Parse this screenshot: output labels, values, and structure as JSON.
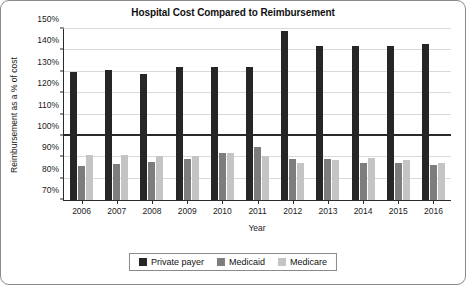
{
  "chart_data": {
    "type": "bar",
    "title": "Hospital Cost Compared to Reimbursement",
    "xlabel": "Year",
    "ylabel": "Reimbursement as a % of cost",
    "categories": [
      "2006",
      "2007",
      "2008",
      "2009",
      "2010",
      "2011",
      "2012",
      "2013",
      "2014",
      "2015",
      "2016"
    ],
    "series": [
      {
        "name": "Private payer",
        "color": "#262626",
        "values": [
          130,
          131,
          129,
          132,
          132,
          132,
          149,
          142,
          142,
          142,
          143
        ]
      },
      {
        "name": "Medicaid",
        "color": "#7d7d7d",
        "values": [
          86,
          87,
          88,
          89,
          92,
          95,
          89,
          89,
          87.5,
          87.5,
          86.5
        ]
      },
      {
        "name": "Medicare",
        "color": "#c4c4c4",
        "values": [
          91,
          91,
          90.5,
          90.5,
          92,
          90.5,
          87.5,
          88.5,
          89.5,
          88.5,
          87.5
        ]
      }
    ],
    "ylim": [
      70,
      150
    ],
    "yticks": [
      70,
      80,
      90,
      100,
      110,
      120,
      130,
      140,
      150
    ],
    "ytick_labels": [
      "70%",
      "80%",
      "90%",
      "100%",
      "110%",
      "120%",
      "130%",
      "140%",
      "150%"
    ],
    "reference_line": 100,
    "grid": true,
    "legend_position": "bottom"
  }
}
